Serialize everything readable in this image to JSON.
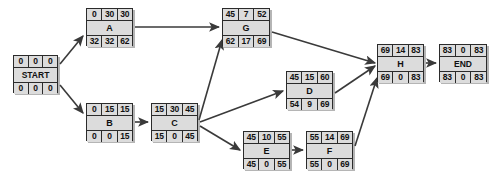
{
  "diagram": {
    "type": "activity-on-node-network",
    "node_format": {
      "top_row": [
        "early-start",
        "duration",
        "early-finish"
      ],
      "middle_row": [
        "activity-label"
      ],
      "bottom_row": [
        "late-start",
        "slack",
        "late-finish"
      ]
    },
    "colors": {
      "node_fill": "#dcdcdc",
      "node_border": "#2b2b2b",
      "edge": "#3a3a3a",
      "background": "#ffffff"
    },
    "nodes": [
      {
        "id": "START",
        "label": "START",
        "x": 13,
        "y": 55,
        "w": 45,
        "h": 38,
        "top": [
          "0",
          "0",
          "0"
        ],
        "bottom": [
          "0",
          "0",
          "0"
        ]
      },
      {
        "id": "A",
        "label": "A",
        "x": 86,
        "y": 8,
        "w": 47,
        "h": 38,
        "top": [
          "0",
          "30",
          "30"
        ],
        "bottom": [
          "32",
          "32",
          "62"
        ]
      },
      {
        "id": "B",
        "label": "B",
        "x": 86,
        "y": 103,
        "w": 47,
        "h": 38,
        "top": [
          "0",
          "15",
          "15"
        ],
        "bottom": [
          "0",
          "0",
          "15"
        ]
      },
      {
        "id": "C",
        "label": "C",
        "x": 151,
        "y": 103,
        "w": 47,
        "h": 38,
        "top": [
          "15",
          "30",
          "45"
        ],
        "bottom": [
          "15",
          "0",
          "45"
        ]
      },
      {
        "id": "G",
        "label": "G",
        "x": 222,
        "y": 8,
        "w": 48,
        "h": 38,
        "top": [
          "45",
          "7",
          "52"
        ],
        "bottom": [
          "62",
          "17",
          "69"
        ]
      },
      {
        "id": "D",
        "label": "D",
        "x": 286,
        "y": 71,
        "w": 47,
        "h": 38,
        "top": [
          "45",
          "15",
          "60"
        ],
        "bottom": [
          "54",
          "9",
          "69"
        ]
      },
      {
        "id": "E",
        "label": "E",
        "x": 243,
        "y": 131,
        "w": 47,
        "h": 38,
        "top": [
          "45",
          "10",
          "55"
        ],
        "bottom": [
          "45",
          "0",
          "55"
        ]
      },
      {
        "id": "F",
        "label": "F",
        "x": 306,
        "y": 131,
        "w": 47,
        "h": 38,
        "top": [
          "55",
          "14",
          "69"
        ],
        "bottom": [
          "55",
          "0",
          "69"
        ]
      },
      {
        "id": "H",
        "label": "H",
        "x": 377,
        "y": 44,
        "w": 47,
        "h": 38,
        "top": [
          "69",
          "14",
          "83"
        ],
        "bottom": [
          "69",
          "0",
          "83"
        ]
      },
      {
        "id": "END",
        "label": "END",
        "x": 439,
        "y": 44,
        "w": 48,
        "h": 38,
        "top": [
          "83",
          "0",
          "83"
        ],
        "bottom": [
          "83",
          "0",
          "83"
        ]
      }
    ],
    "edges": [
      {
        "from": "START",
        "to": "A"
      },
      {
        "from": "START",
        "to": "B"
      },
      {
        "from": "A",
        "to": "G"
      },
      {
        "from": "B",
        "to": "C"
      },
      {
        "from": "C",
        "to": "G"
      },
      {
        "from": "C",
        "to": "D"
      },
      {
        "from": "C",
        "to": "E"
      },
      {
        "from": "G",
        "to": "H"
      },
      {
        "from": "D",
        "to": "H"
      },
      {
        "from": "E",
        "to": "F"
      },
      {
        "from": "F",
        "to": "H"
      },
      {
        "from": "H",
        "to": "END"
      }
    ]
  }
}
